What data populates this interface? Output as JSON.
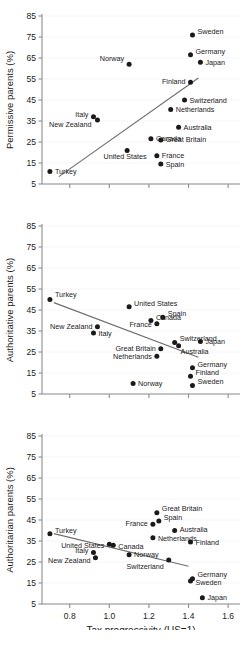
{
  "figure": {
    "xlabel": "Tax progressivity (US=1)",
    "xticks": [
      "0.8",
      "1.0",
      "1.2",
      "1.4",
      "1.6"
    ],
    "xtick_values": [
      0.8,
      1.0,
      1.2,
      1.4,
      1.6
    ],
    "yticks": [
      "85",
      "75",
      "65",
      "55",
      "45",
      "35",
      "25",
      "15",
      "5"
    ],
    "ytick_values": [
      85,
      75,
      65,
      55,
      45,
      35,
      25,
      15,
      5
    ],
    "xlim": [
      0.66,
      1.66
    ],
    "ylim": [
      0,
      90
    ],
    "marker_color": "#1a1a1a",
    "trend_color": "#6e6e6e",
    "axis_color": "#8c8c8c"
  },
  "chart_data": [
    {
      "type": "scatter",
      "title": "",
      "xlabel": "",
      "ylabel": "Permissive parents (%)",
      "xlim": [
        0.66,
        1.66
      ],
      "ylim": [
        0,
        90
      ],
      "grid": false,
      "legend": "none",
      "trendline": {
        "x0": 0.745,
        "y0": 8.5,
        "x1": 1.45,
        "y1": 55.5
      },
      "points": [
        {
          "label": "Turkey",
          "x": 0.7,
          "y": 11,
          "label_dx": 5,
          "label_dy": 2.5,
          "anchor": "start"
        },
        {
          "label": "Italy",
          "x": 0.92,
          "y": 37,
          "label_dx": -5,
          "label_dy": 0,
          "anchor": "end"
        },
        {
          "label": "New Zealand",
          "x": 0.94,
          "y": 35.5,
          "label_dx": -6,
          "label_dy": 7.5,
          "anchor": "end"
        },
        {
          "label": "United States",
          "x": 1.09,
          "y": 21,
          "label_dx": -2,
          "label_dy": 9,
          "anchor": "middle"
        },
        {
          "label": "Canada",
          "x": 1.21,
          "y": 26.5,
          "label_dx": 5,
          "label_dy": 2.5,
          "anchor": "start"
        },
        {
          "label": "Norway",
          "x": 1.1,
          "y": 62,
          "label_dx": -5,
          "label_dy": -3,
          "anchor": "end"
        },
        {
          "label": "Finland",
          "x": 1.41,
          "y": 53.5,
          "label_dx": -5,
          "label_dy": 1.5,
          "anchor": "end"
        },
        {
          "label": "Switzerland",
          "x": 1.38,
          "y": 45,
          "label_dx": 5,
          "label_dy": 2.5,
          "anchor": "start"
        },
        {
          "label": "Netherlands",
          "x": 1.31,
          "y": 40.5,
          "label_dx": 5,
          "label_dy": 2.5,
          "anchor": "start"
        },
        {
          "label": "Australia",
          "x": 1.35,
          "y": 32,
          "label_dx": 5,
          "label_dy": 2.5,
          "anchor": "start"
        },
        {
          "label": "Great Britain",
          "x": 1.26,
          "y": 26,
          "label_dx": 5,
          "label_dy": 2.5,
          "anchor": "start"
        },
        {
          "label": "France",
          "x": 1.24,
          "y": 18.5,
          "label_dx": 5,
          "label_dy": 2.5,
          "anchor": "start"
        },
        {
          "label": "Spain",
          "x": 1.26,
          "y": 14.5,
          "label_dx": 5,
          "label_dy": 2.5,
          "anchor": "start"
        },
        {
          "label": "Sweden",
          "x": 1.42,
          "y": 76,
          "label_dx": 5,
          "label_dy": -1,
          "anchor": "start"
        },
        {
          "label": "Germany",
          "x": 1.41,
          "y": 66.5,
          "label_dx": 5,
          "label_dy": -1,
          "anchor": "start"
        },
        {
          "label": "Japan",
          "x": 1.46,
          "y": 63,
          "label_dx": 5,
          "label_dy": 2.5,
          "anchor": "start"
        }
      ]
    },
    {
      "type": "scatter",
      "title": "",
      "xlabel": "",
      "ylabel": "Authoritative parents (%)",
      "xlim": [
        0.66,
        1.66
      ],
      "ylim": [
        0,
        90
      ],
      "grid": false,
      "legend": "none",
      "trendline": {
        "x0": 0.72,
        "y0": 48.5,
        "x1": 1.45,
        "y1": 22.5
      },
      "points": [
        {
          "label": "Turkey",
          "x": 0.7,
          "y": 50,
          "label_dx": 5,
          "label_dy": -3,
          "anchor": "start"
        },
        {
          "label": "United States",
          "x": 1.1,
          "y": 46.5,
          "label_dx": 5,
          "label_dy": -1,
          "anchor": "start"
        },
        {
          "label": "Canada",
          "x": 1.21,
          "y": 40,
          "label_dx": 5,
          "label_dy": -1,
          "anchor": "start"
        },
        {
          "label": "New Zealand",
          "x": 0.94,
          "y": 37,
          "label_dx": -5,
          "label_dy": 2.5,
          "anchor": "end"
        },
        {
          "label": "Italy",
          "x": 0.92,
          "y": 34,
          "label_dx": 5,
          "label_dy": 3,
          "anchor": "start"
        },
        {
          "label": "Spain",
          "x": 1.27,
          "y": 41.5,
          "label_dx": 5,
          "label_dy": -1,
          "anchor": "start"
        },
        {
          "label": "France",
          "x": 1.24,
          "y": 38.5,
          "label_dx": -5,
          "label_dy": 3,
          "anchor": "end"
        },
        {
          "label": "Switzerland",
          "x": 1.33,
          "y": 29.5,
          "label_dx": 5,
          "label_dy": -2,
          "anchor": "start"
        },
        {
          "label": "Japan",
          "x": 1.46,
          "y": 30,
          "label_dx": 5,
          "label_dy": 2.5,
          "anchor": "start"
        },
        {
          "label": "Australia",
          "x": 1.35,
          "y": 28,
          "label_dx": 2,
          "label_dy": 8,
          "anchor": "start"
        },
        {
          "label": "Great Britain",
          "x": 1.26,
          "y": 26.5,
          "label_dx": -5,
          "label_dy": 2.5,
          "anchor": "end"
        },
        {
          "label": "Netherlands",
          "x": 1.24,
          "y": 23,
          "label_dx": -5,
          "label_dy": 2.5,
          "anchor": "end"
        },
        {
          "label": "Germany",
          "x": 1.42,
          "y": 17.5,
          "label_dx": 5,
          "label_dy": -1,
          "anchor": "start"
        },
        {
          "label": "Finland",
          "x": 1.41,
          "y": 13.5,
          "label_dx": 5,
          "label_dy": -1,
          "anchor": "start"
        },
        {
          "label": "Sweden",
          "x": 1.42,
          "y": 9,
          "label_dx": 5,
          "label_dy": -2,
          "anchor": "start"
        },
        {
          "label": "Norway",
          "x": 1.12,
          "y": 10,
          "label_dx": 5,
          "label_dy": 2.5,
          "anchor": "start"
        }
      ]
    },
    {
      "type": "scatter",
      "title": "",
      "xlabel": "Tax progressivity (US=1)",
      "ylabel": "Authoritarian parents (%)",
      "xlim": [
        0.66,
        1.66
      ],
      "ylim": [
        0,
        90
      ],
      "grid": false,
      "legend": "none",
      "trendline": {
        "x0": 0.72,
        "y0": 38.5,
        "x1": 1.4,
        "y1": 23.0
      },
      "points": [
        {
          "label": "Turkey",
          "x": 0.7,
          "y": 38.5,
          "label_dx": 5,
          "label_dy": -1,
          "anchor": "start"
        },
        {
          "label": "United States",
          "x": 1.0,
          "y": 33.5,
          "label_dx": -5,
          "label_dy": 4,
          "anchor": "end"
        },
        {
          "label": "Canada",
          "x": 1.02,
          "y": 33,
          "label_dx": 5,
          "label_dy": 3.5,
          "anchor": "start"
        },
        {
          "label": "Italy",
          "x": 0.92,
          "y": 29.5,
          "label_dx": -5,
          "label_dy": 0,
          "anchor": "end"
        },
        {
          "label": "New Zealand",
          "x": 0.93,
          "y": 27,
          "label_dx": -5,
          "label_dy": 5,
          "anchor": "end"
        },
        {
          "label": "Norway",
          "x": 1.1,
          "y": 28.5,
          "label_dx": 5,
          "label_dy": 2,
          "anchor": "start"
        },
        {
          "label": "Great Britain",
          "x": 1.24,
          "y": 48.5,
          "label_dx": 5,
          "label_dy": -2,
          "anchor": "start"
        },
        {
          "label": "Spain",
          "x": 1.25,
          "y": 44.5,
          "label_dx": 5,
          "label_dy": -1,
          "anchor": "start"
        },
        {
          "label": "France",
          "x": 1.22,
          "y": 43,
          "label_dx": -5,
          "label_dy": 1.5,
          "anchor": "end"
        },
        {
          "label": "Australia",
          "x": 1.33,
          "y": 40,
          "label_dx": 5,
          "label_dy": 1.5,
          "anchor": "start"
        },
        {
          "label": "Netherlands",
          "x": 1.22,
          "y": 36.5,
          "label_dx": 5,
          "label_dy": 3.5,
          "anchor": "start"
        },
        {
          "label": "Finland",
          "x": 1.41,
          "y": 34.5,
          "label_dx": 5,
          "label_dy": 3,
          "anchor": "start"
        },
        {
          "label": "Switzerland",
          "x": 1.3,
          "y": 26,
          "label_dx": -5,
          "label_dy": 9,
          "anchor": "end"
        },
        {
          "label": "Germany",
          "x": 1.42,
          "y": 17,
          "label_dx": 5,
          "label_dy": -2,
          "anchor": "start"
        },
        {
          "label": "Sweden",
          "x": 1.41,
          "y": 16,
          "label_dx": 5,
          "label_dy": 4,
          "anchor": "start"
        },
        {
          "label": "Japan",
          "x": 1.47,
          "y": 8,
          "label_dx": 5,
          "label_dy": 2.5,
          "anchor": "start"
        }
      ]
    }
  ]
}
